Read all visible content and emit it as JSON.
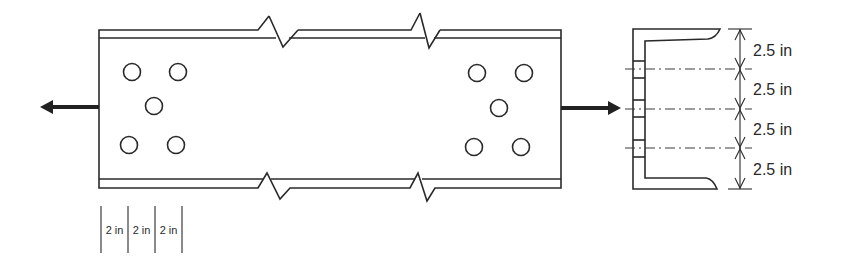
{
  "diagram": {
    "colors": {
      "stroke": "#2a2a2a",
      "background": "#ffffff"
    },
    "plan_view": {
      "plate": {
        "left_x": 99,
        "right_x": 561,
        "top_outer_y": 30,
        "top_inner_y": 38,
        "bottom_inner_y": 179,
        "bottom_outer_y": 188
      },
      "break_lines": [
        {
          "position": "top-left",
          "points": [
            [
              258,
              30
            ],
            [
              269,
              16
            ],
            [
              283,
              47
            ],
            [
              298,
              30
            ]
          ]
        },
        {
          "position": "top-right",
          "points": [
            [
              411,
              30
            ],
            [
              420,
              13
            ],
            [
              429,
              48
            ],
            [
              440,
              30
            ]
          ]
        },
        {
          "position": "bottom-left",
          "points": [
            [
              258,
              188
            ],
            [
              267,
              173
            ],
            [
              280,
              199
            ],
            [
              290,
              188
            ]
          ]
        },
        {
          "position": "bottom-right",
          "points": [
            [
              410,
              188
            ],
            [
              418,
              173
            ],
            [
              427,
              201
            ],
            [
              435,
              188
            ]
          ]
        }
      ],
      "bolt_holes_left": [
        {
          "cx": 132,
          "cy": 72
        },
        {
          "cx": 178,
          "cy": 72
        },
        {
          "cx": 154,
          "cy": 106
        },
        {
          "cx": 129,
          "cy": 145
        },
        {
          "cx": 176,
          "cy": 145
        }
      ],
      "bolt_holes_right": [
        {
          "cx": 477,
          "cy": 73
        },
        {
          "cx": 524,
          "cy": 73
        },
        {
          "cx": 499,
          "cy": 108
        },
        {
          "cx": 474,
          "cy": 147
        },
        {
          "cx": 521,
          "cy": 147
        }
      ],
      "hole_radius": 8.5,
      "forces": [
        {
          "name": "tension-force-left",
          "direction": "left",
          "from_x": 99,
          "to_x": 40,
          "y": 107
        },
        {
          "name": "tension-force-right",
          "direction": "right",
          "from_x": 561,
          "to_x": 621,
          "y": 108
        }
      ],
      "pitch_dimensions": {
        "tick_x": [
          101,
          128,
          155,
          182
        ],
        "y_top": 206,
        "y_bottom": 253,
        "labels": [
          "2 in",
          "2 in",
          "2 in"
        ]
      }
    },
    "section_view": {
      "web_outer_x": 633,
      "web_inner_x": 645,
      "top_outer_y": 29,
      "top_inner_y": 41,
      "bottom_inner_y": 178,
      "bottom_outer_y": 189,
      "flange_tip_x": 720,
      "hole_marks": [
        [
          61,
          78
        ],
        [
          100,
          117
        ],
        [
          140,
          157
        ]
      ],
      "centerlines_y": [
        69,
        109,
        148
      ],
      "gage_dimensions": {
        "line_x": 740,
        "ext_y": [
          29,
          69,
          109,
          148,
          189
        ],
        "labels": [
          "2.5 in",
          "2.5 in",
          "2.5 in",
          "2.5 in"
        ],
        "label_y": [
          56,
          95,
          135,
          175
        ]
      }
    }
  }
}
